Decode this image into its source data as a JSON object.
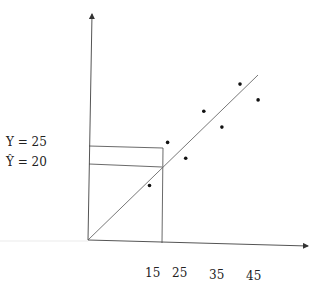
{
  "diagram": {
    "type": "regression-scatter",
    "y_labels": {
      "observed": "Y = 25",
      "predicted": "Ŷ = 20"
    },
    "x_tick_labels": [
      "15",
      "25",
      "35",
      "45"
    ],
    "points": [
      {
        "x": 17,
        "y": 14
      },
      {
        "x": 22,
        "y": 25
      },
      {
        "x": 27,
        "y": 21
      },
      {
        "x": 32,
        "y": 33
      },
      {
        "x": 37,
        "y": 29
      },
      {
        "x": 42,
        "y": 40
      },
      {
        "x": 47,
        "y": 36
      }
    ],
    "highlighted_point": {
      "x": 22,
      "y": 25,
      "y_hat": 20
    },
    "fit_line": {
      "x_start": 0,
      "y_start": 0,
      "x_end": 47,
      "y_end": 42
    },
    "colors": {
      "ink": "#222222",
      "axis": "#555555"
    }
  }
}
